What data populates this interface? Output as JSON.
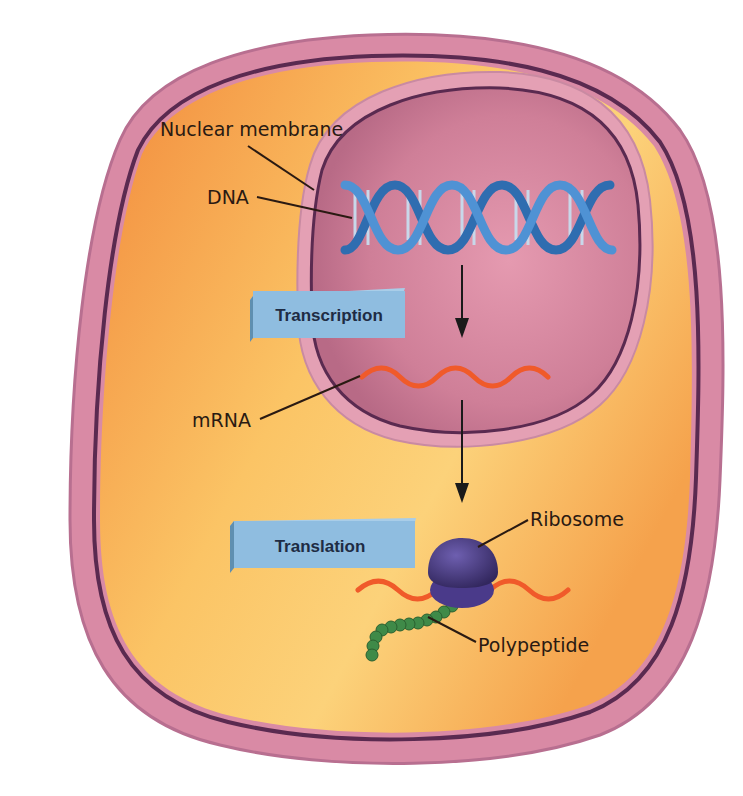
{
  "diagram": {
    "labels": {
      "nuclear_membrane": "Nuclear membrane",
      "dna": "DNA",
      "mrna": "mRNA",
      "ribosome": "Ribosome",
      "polypeptide": "Polypeptide"
    },
    "process_boxes": {
      "transcription": "Transcription",
      "translation": "Translation"
    },
    "colors": {
      "cytoplasm": "#f49a45",
      "cytoplasm_light": "#fcd27a",
      "cell_membrane": "#d98aa5",
      "membrane_dark": "#5a2a50",
      "nucleus": "#c97890",
      "nucleus_light": "#e4a0b4",
      "dna": "#3f7fc4",
      "mrna": "#f05a2a",
      "ribosome": "#4a3a8a",
      "polypeptide": "#3f8a48",
      "process_box": "#8fbde0",
      "process_box_side": "#5f8fb0",
      "arrow": "#1a1a1a"
    }
  }
}
